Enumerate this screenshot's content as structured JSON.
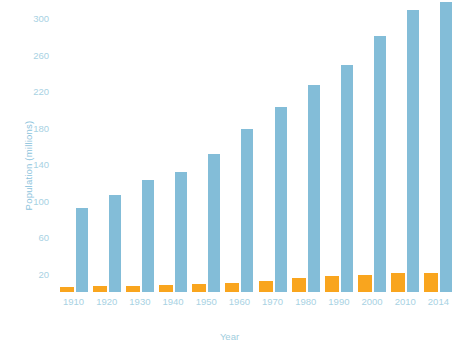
{
  "chart_data": {
    "type": "bar",
    "title": "",
    "xlabel": "Year",
    "ylabel": "Population (millions)",
    "categories": [
      "1910",
      "1920",
      "1930",
      "1940",
      "1950",
      "1960",
      "1970",
      "1980",
      "1990",
      "2000",
      "2010",
      "2014"
    ],
    "series": [
      {
        "name": "Population",
        "color": "#83bdd8",
        "values": [
          92,
          106,
          123,
          132,
          151,
          179,
          203,
          227,
          249,
          281,
          309,
          318
        ]
      },
      {
        "name": "Secondary population",
        "color": "#f9a51e",
        "values": [
          6,
          6.5,
          7,
          7.5,
          8.5,
          10,
          12,
          15,
          17.5,
          19,
          21,
          21
        ]
      }
    ],
    "ylim": [
      0,
      320
    ],
    "yticks": [
      20,
      60,
      100,
      140,
      180,
      220,
      260,
      300
    ],
    "ytick_labels": [
      "20",
      "60",
      "100",
      "140",
      "180",
      "220",
      "260",
      "300"
    ],
    "grid": false,
    "legend": "none",
    "axis_label_color": "#a8d2e3"
  },
  "watermark": {
    "text": ""
  }
}
